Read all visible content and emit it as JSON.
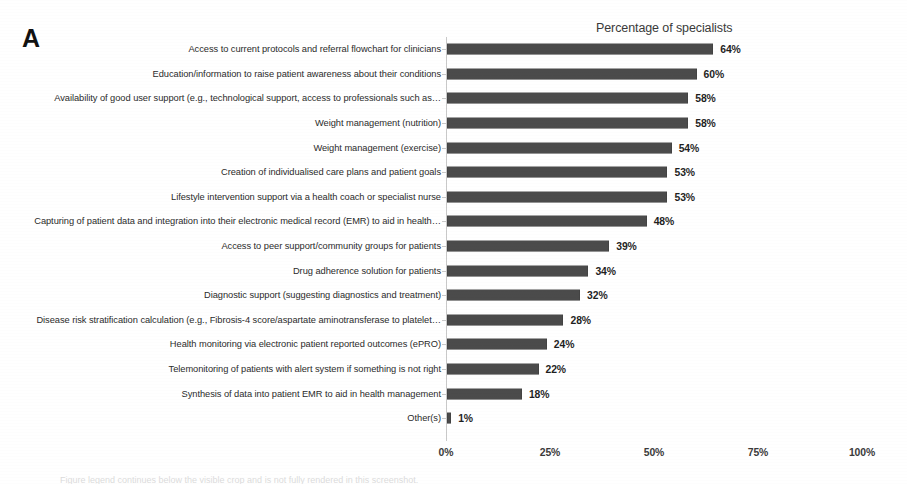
{
  "figure": {
    "panel_letter": "A",
    "caption_partial": "Figure legend continues below the visible crop and is not fully rendered in this screenshot."
  },
  "chart_data": {
    "type": "bar",
    "orientation": "horizontal",
    "title": "Percentage of specialists",
    "xlabel": "",
    "ylabel": "",
    "xlim": [
      0,
      100
    ],
    "grid": false,
    "legend": false,
    "value_suffix": "%",
    "bar_color": "#4b4b4b",
    "axis_color": "#c9c9c9",
    "xticks": [
      "0%",
      "25%",
      "50%",
      "75%",
      "100%"
    ],
    "xtick_values": [
      0,
      25,
      50,
      75,
      100
    ],
    "categories": [
      "Access to current protocols and referral flowchart for clinicians",
      "Education/information to raise patient awareness about their conditions",
      "Availability of good user support (e.g., technological support, access to professionals such as…",
      "Weight management (nutrition)",
      "Weight management (exercise)",
      "Creation of individualised care plans and patient goals",
      "Lifestyle intervention support via a health coach or specialist nurse",
      "Capturing of patient data and integration into their electronic medical record (EMR) to aid in health…",
      "Access to peer support/community groups for patients",
      "Drug adherence solution for patients",
      "Diagnostic support (suggesting diagnostics and treatment)",
      "Disease risk stratification calculation (e.g., Fibrosis-4 score/aspartate aminotransferase to platelet…",
      "Health monitoring via electronic patient reported outcomes (ePRO)",
      "Telemonitoring of patients with alert system if something is not right",
      "Synthesis of data into patient EMR to aid in health management",
      "Other(s)"
    ],
    "values": [
      64,
      60,
      58,
      58,
      54,
      53,
      53,
      48,
      39,
      34,
      32,
      28,
      24,
      22,
      18,
      1
    ],
    "value_labels": [
      "64%",
      "60%",
      "58%",
      "58%",
      "54%",
      "53%",
      "53%",
      "48%",
      "39%",
      "34%",
      "32%",
      "28%",
      "24%",
      "22%",
      "18%",
      "1%"
    ]
  }
}
